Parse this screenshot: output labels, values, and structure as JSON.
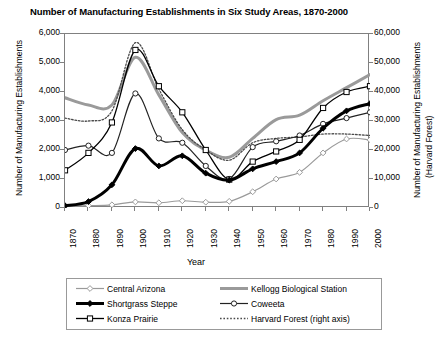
{
  "chart_data": {
    "type": "line",
    "title": "Number of Manufacturing Establishments in Six Study Areas, 1870-2000",
    "xlabel": "Year",
    "ylabel": "Number of Manufacturing Establishments",
    "ylabel_right_line1": "Number of Manufacturing Establishments",
    "ylabel_right_line2": "(Harvard Forest)",
    "grid": false,
    "legend_position": "bottom",
    "x": [
      1870,
      1880,
      1890,
      1900,
      1910,
      1920,
      1930,
      1940,
      1950,
      1960,
      1970,
      1980,
      1990,
      2000
    ],
    "xlim": [
      1870,
      2000
    ],
    "xticklabels": [
      "1870",
      "1880",
      "1890",
      "1900",
      "1910",
      "1920",
      "1930",
      "1940",
      "1950",
      "1960",
      "1970",
      "1980",
      "1990",
      "2000"
    ],
    "ylim": [
      0,
      6000
    ],
    "yticklabels": [
      "0",
      "1,000",
      "2,000",
      "3,000",
      "4,000",
      "5,000",
      "6,000"
    ],
    "ylim_right": [
      0,
      60000
    ],
    "yticklabels_right": [
      "0",
      "10,000",
      "20,000",
      "30,000",
      "40,000",
      "50,000",
      "60,000"
    ],
    "series": [
      {
        "name": "Central Arizona",
        "axis": "left",
        "color": "#9a9a9a",
        "marker": "open-diamond",
        "width": 1.2,
        "dash": "none",
        "values": [
          60,
          80,
          110,
          210,
          180,
          250,
          200,
          230,
          560,
          1000,
          1230,
          1900,
          2380,
          2350
        ]
      },
      {
        "name": "Kellogg Biological Station",
        "axis": "left",
        "color": "#9a9a9a",
        "marker": "none",
        "width": 3.0,
        "dash": "none",
        "values": [
          3800,
          3550,
          3550,
          5200,
          3900,
          2600,
          2000,
          1750,
          2400,
          3050,
          3200,
          3700,
          4150,
          4600
        ]
      },
      {
        "name": "Shortgrass Steppe",
        "axis": "left",
        "color": "#000000",
        "marker": "filled-diamond",
        "width": 3.0,
        "dash": "none",
        "values": [
          80,
          220,
          800,
          2050,
          1450,
          1800,
          1200,
          960,
          1350,
          1600,
          1900,
          2750,
          3350,
          3600
        ]
      },
      {
        "name": "Coweeta",
        "axis": "left",
        "color": "#222222",
        "marker": "open-circle",
        "width": 1.2,
        "dash": "none",
        "values": [
          2000,
          2150,
          1900,
          3950,
          2400,
          2250,
          1450,
          1000,
          2100,
          2300,
          2500,
          2900,
          3100,
          3300
        ]
      },
      {
        "name": "Konza Prairie",
        "axis": "left",
        "color": "#000000",
        "marker": "open-square",
        "width": 1.3,
        "dash": "none",
        "values": [
          1300,
          1900,
          2950,
          5450,
          4200,
          3300,
          2000,
          980,
          1600,
          1950,
          2350,
          3450,
          4000,
          4200
        ]
      },
      {
        "name": "Harvard Forest (right axis)",
        "axis": "right",
        "color": "#4a4a4a",
        "marker": "none",
        "width": 1.3,
        "dash": "dotted",
        "values": [
          31000,
          30000,
          33500,
          57000,
          41000,
          27000,
          20000,
          16500,
          22500,
          24000,
          24500,
          25500,
          25500,
          25000
        ]
      }
    ]
  },
  "legend": {
    "items": [
      {
        "label": "Central Arizona"
      },
      {
        "label": "Kellogg Biological Station"
      },
      {
        "label": "Shortgrass Steppe"
      },
      {
        "label": "Coweeta"
      },
      {
        "label": "Konza Prairie"
      },
      {
        "label": "Harvard Forest (right axis)"
      }
    ]
  }
}
